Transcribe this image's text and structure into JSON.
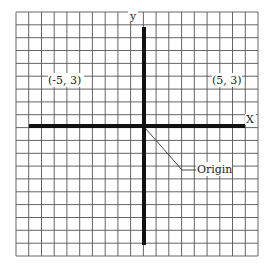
{
  "diagram": {
    "grid": {
      "columns": 19,
      "rows": 19,
      "line_color": "#444444"
    },
    "axes": {
      "x_label": "X",
      "y_label": "y",
      "color": "#111111"
    },
    "points": [
      {
        "label": "(-5, 3)",
        "x": -5,
        "y": 3
      },
      {
        "label": "(5, 3)",
        "x": 5,
        "y": 3
      }
    ],
    "annotation": {
      "label": "Origin",
      "target": [
        0,
        0
      ]
    }
  }
}
